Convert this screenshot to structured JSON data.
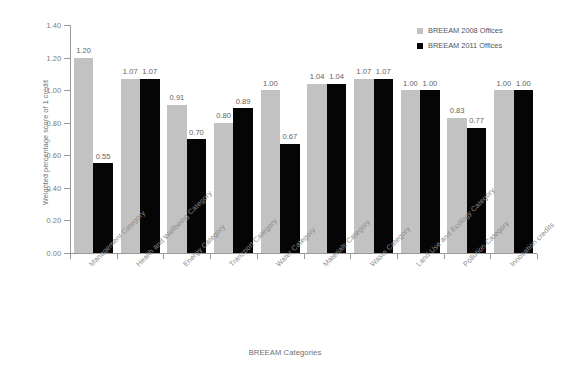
{
  "chart_data": {
    "type": "bar",
    "title": "",
    "xlabel": "BREEAM Categories",
    "ylabel": "Weighted percentage score of 1 credit",
    "ylim": [
      0.0,
      1.4
    ],
    "yticks": [
      "0.00",
      "0.20",
      "0.40",
      "0.60",
      "0.80",
      "1.00",
      "1.20",
      "1.40"
    ],
    "ytick_values": [
      0.0,
      0.2,
      0.4,
      0.6,
      0.8,
      1.0,
      1.2,
      1.4
    ],
    "grid": false,
    "legend_position": "top-right",
    "categories": [
      "Management Category",
      "Health and Wellbeing Category",
      "Energy Category",
      "Transport Category",
      "Water Category",
      "Materials Category",
      "Waste Category",
      "Land Use and Ecology Category",
      "Pollution Category",
      "Innovation credits"
    ],
    "series": [
      {
        "name": "BREEAM 2008 Offices",
        "color": "#c2c2c2",
        "values": [
          1.2,
          1.07,
          0.91,
          0.8,
          1.0,
          1.04,
          1.07,
          1.0,
          0.83,
          1.0
        ],
        "labels": [
          "1.20",
          "1.07",
          "0.91",
          "0.80",
          "1.00",
          "1.04",
          "1.07",
          "1.00",
          "0.83",
          "1.00"
        ]
      },
      {
        "name": "BREEAM 2011 Offices",
        "color": "#050505",
        "values": [
          0.55,
          1.07,
          0.7,
          0.89,
          0.67,
          1.04,
          1.07,
          1.0,
          0.77,
          1.0
        ],
        "labels": [
          "0.55",
          "1.07",
          "0.70",
          "0.89",
          "0.67",
          "1.04",
          "1.07",
          "1.00",
          "0.77",
          "1.00"
        ]
      }
    ]
  },
  "legend": {
    "items": [
      {
        "label": "BREEAM 2008 Offices",
        "swatch": "legend-swatch-2008"
      },
      {
        "label": "BREEAM 2011 Offices",
        "swatch": "legend-swatch-2011"
      }
    ]
  }
}
